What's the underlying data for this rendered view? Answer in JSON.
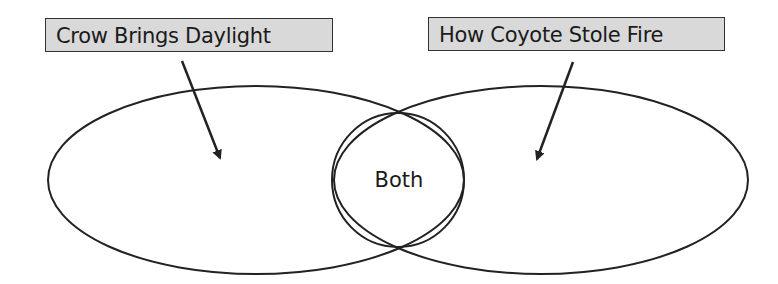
{
  "diagram": {
    "type": "venn",
    "labels": {
      "left": "Crow Brings Daylight",
      "right": "How Coyote Stole Fire",
      "center": "Both"
    },
    "colors": {
      "label_fill": "#d9d9d9",
      "stroke": "#222222"
    }
  }
}
